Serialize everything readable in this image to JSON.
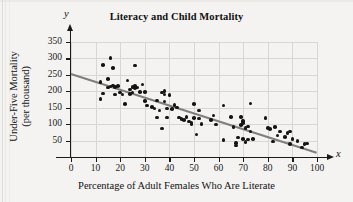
{
  "chart_data": {
    "type": "scatter",
    "title": "Literacy and Child Mortality",
    "xlabel": "Percentage of Adult Females Who Are Literate",
    "ylabel": "Under-Five Mortality (per thousand)",
    "ylabel_line1": "Under-Five Mortality",
    "ylabel_line2": "(per thousand)",
    "x_axis_variable": "x",
    "y_axis_variable": "y",
    "xlim": [
      0,
      100
    ],
    "ylim": [
      0,
      350
    ],
    "xticks": [
      0,
      10,
      20,
      30,
      40,
      50,
      60,
      70,
      80,
      90,
      100
    ],
    "yticks": [
      50,
      100,
      150,
      200,
      250,
      300,
      350
    ],
    "grid": true,
    "legend": "none",
    "point_color": "#141414",
    "trendline_color": "#7e7e7e",
    "trendline": {
      "label": "least-squares regression line",
      "x_start": 0,
      "y_start": 255,
      "x_end": 100,
      "y_end": 15
    },
    "points": [
      [
        12,
        228
      ],
      [
        12,
        176
      ],
      [
        13,
        280
      ],
      [
        13,
        193
      ],
      [
        15,
        238
      ],
      [
        15,
        212
      ],
      [
        16,
        302
      ],
      [
        16,
        215
      ],
      [
        17,
        270
      ],
      [
        17,
        218
      ],
      [
        18,
        213
      ],
      [
        18,
        190
      ],
      [
        19,
        216
      ],
      [
        20,
        196
      ],
      [
        21,
        190
      ],
      [
        22,
        162
      ],
      [
        23,
        233
      ],
      [
        24,
        205
      ],
      [
        24,
        192
      ],
      [
        25,
        213
      ],
      [
        25,
        196
      ],
      [
        26,
        279
      ],
      [
        26,
        216
      ],
      [
        26,
        210
      ],
      [
        27,
        211
      ],
      [
        28,
        197
      ],
      [
        29,
        221
      ],
      [
        30,
        198
      ],
      [
        30,
        171
      ],
      [
        31,
        157
      ],
      [
        33,
        152
      ],
      [
        34,
        148
      ],
      [
        35,
        172
      ],
      [
        35,
        120
      ],
      [
        36,
        142
      ],
      [
        37,
        196
      ],
      [
        37,
        87
      ],
      [
        38,
        201
      ],
      [
        38,
        190
      ],
      [
        38,
        169
      ],
      [
        39,
        148
      ],
      [
        39,
        120
      ],
      [
        40,
        188
      ],
      [
        41,
        146
      ],
      [
        42,
        158
      ],
      [
        43,
        151
      ],
      [
        44,
        120
      ],
      [
        45,
        116
      ],
      [
        46,
        112
      ],
      [
        47,
        122
      ],
      [
        48,
        108
      ],
      [
        49,
        99
      ],
      [
        49,
        104
      ],
      [
        50,
        162
      ],
      [
        50,
        118
      ],
      [
        51,
        69
      ],
      [
        52,
        142
      ],
      [
        52,
        117
      ],
      [
        53,
        100
      ],
      [
        57,
        113
      ],
      [
        58,
        126
      ],
      [
        59,
        99
      ],
      [
        62,
        157
      ],
      [
        62,
        52
      ],
      [
        65,
        121
      ],
      [
        66,
        91
      ],
      [
        67,
        35
      ],
      [
        67,
        43
      ],
      [
        68,
        59
      ],
      [
        69,
        121
      ],
      [
        69,
        97
      ],
      [
        70,
        104
      ],
      [
        70,
        110
      ],
      [
        70,
        54
      ],
      [
        71,
        88
      ],
      [
        71,
        46
      ],
      [
        72,
        93
      ],
      [
        72,
        53
      ],
      [
        73,
        163
      ],
      [
        73,
        77
      ],
      [
        74,
        55
      ],
      [
        79,
        118
      ],
      [
        80,
        89
      ],
      [
        81,
        85
      ],
      [
        82,
        47
      ],
      [
        83,
        92
      ],
      [
        84,
        66
      ],
      [
        85,
        78
      ],
      [
        87,
        60
      ],
      [
        88,
        73
      ],
      [
        89,
        77
      ],
      [
        89,
        40
      ],
      [
        90,
        55
      ],
      [
        92,
        48
      ],
      [
        94,
        29
      ],
      [
        95,
        39
      ],
      [
        96,
        41
      ]
    ]
  }
}
